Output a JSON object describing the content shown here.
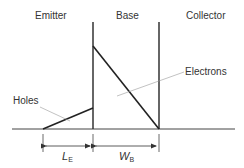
{
  "diagram": {
    "regions": [
      {
        "label": "Emitter"
      },
      {
        "label": "Base"
      },
      {
        "label": "Collector"
      }
    ],
    "annotations": {
      "electrons": "Electrons",
      "holes": "Holes"
    },
    "dimensions": {
      "emitter_length": {
        "symbol": "L",
        "subscript": "E"
      },
      "base_width": {
        "symbol": "W",
        "subscript": "B"
      }
    },
    "colors": {
      "line": "#333333",
      "leader": "#888888",
      "background": "#ffffff"
    }
  }
}
